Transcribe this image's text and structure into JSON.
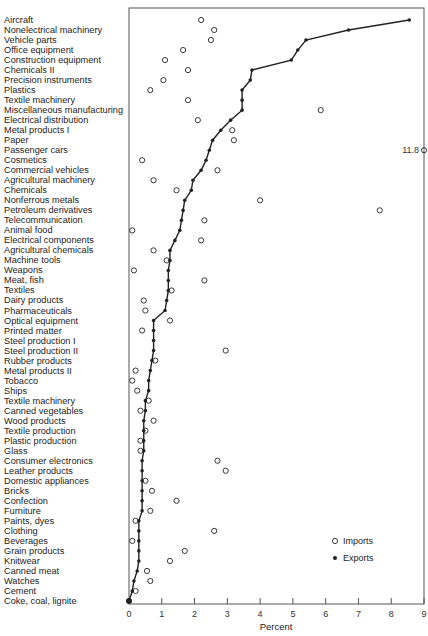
{
  "chart_data": {
    "type": "scatter",
    "title": "",
    "xlabel": "Percent",
    "ylabel": "",
    "xlim": [
      0,
      9
    ],
    "x_ticks": [
      "0",
      "1",
      "2",
      "3",
      "4",
      "5",
      "6",
      "7",
      "8",
      "9"
    ],
    "grid": false,
    "legend_position": "lower right",
    "legend": [
      {
        "name": "Imports",
        "marker": "open-circle"
      },
      {
        "name": "Exports",
        "marker": "filled-dot-line"
      }
    ],
    "annotations": [
      {
        "text": "11.8",
        "category": "Passenger cars",
        "series": "Imports",
        "note": "off-scale value plotted at right edge"
      }
    ],
    "categories": [
      "Aircraft",
      "Nonelectrical machinery",
      "Vehicle parts",
      "Office equipment",
      "Construction equipment",
      "Chemicals II",
      "Precision instruments",
      "Plastics",
      "Textile machinery",
      "Miscellaneous manufacturing",
      "Electrical distribution",
      "Metal products I",
      "Paper",
      "Passenger cars",
      "Cosmetics",
      "Commercial vehicles",
      "Agricultural machinery",
      "Chemicals",
      "Nonferrous metals",
      "Petroleum derivatives",
      "Telecommunication",
      "Animal food",
      "Electrical components",
      "Agricultural chemicals",
      "Machine tools",
      "Weapons",
      "Meat, fish",
      "Textiles",
      "Dairy products",
      "Pharmaceuticals",
      "Optical equipment",
      "Printed matter",
      "Steel production I",
      "Steel production II",
      "Rubber products",
      "Metal products II",
      "Tobacco",
      "Ships",
      "Textile machinery",
      "Canned vegetables",
      "Wood products",
      "Textile production",
      "Plastic production",
      "Glass",
      "Consumer electronics",
      "Leather products",
      "Domestic appliances",
      "Bricks",
      "Confection",
      "Furniture",
      "Paints, dyes",
      "Clothing",
      "Beverages",
      "Grain products",
      "Knitwear",
      "Canned meat",
      "Watches",
      "Cement",
      "Coke, coal, lignite"
    ],
    "series": [
      {
        "name": "Imports",
        "values": [
          2.2,
          2.6,
          2.5,
          1.65,
          1.1,
          1.8,
          1.05,
          0.65,
          1.8,
          5.85,
          2.1,
          3.15,
          3.2,
          11.8,
          0.4,
          2.7,
          0.75,
          1.45,
          4.0,
          7.65,
          2.3,
          0.1,
          2.2,
          0.75,
          1.15,
          0.15,
          2.3,
          1.3,
          0.45,
          0.5,
          1.25,
          0.4,
          null,
          2.95,
          0.8,
          0.2,
          0.1,
          0.25,
          0.6,
          0.35,
          0.75,
          0.5,
          0.35,
          0.35,
          2.7,
          2.95,
          0.5,
          0.7,
          1.45,
          0.65,
          0.2,
          2.6,
          0.1,
          1.7,
          1.25,
          0.55,
          0.65,
          0.2,
          0.0
        ]
      },
      {
        "name": "Exports",
        "values": [
          8.55,
          6.7,
          5.4,
          5.15,
          4.95,
          3.75,
          3.7,
          3.45,
          3.45,
          3.45,
          3.1,
          2.8,
          2.55,
          2.45,
          2.35,
          2.2,
          1.95,
          1.9,
          1.7,
          1.65,
          1.6,
          1.55,
          1.4,
          1.25,
          1.25,
          1.2,
          1.2,
          1.2,
          1.15,
          1.1,
          0.75,
          0.75,
          0.75,
          0.75,
          0.7,
          0.65,
          0.6,
          0.6,
          0.5,
          0.5,
          0.45,
          0.45,
          0.45,
          0.45,
          0.4,
          0.4,
          0.4,
          0.4,
          0.4,
          0.4,
          0.3,
          0.3,
          0.3,
          0.3,
          0.3,
          0.25,
          0.15,
          0.1,
          0.0
        ]
      }
    ]
  }
}
